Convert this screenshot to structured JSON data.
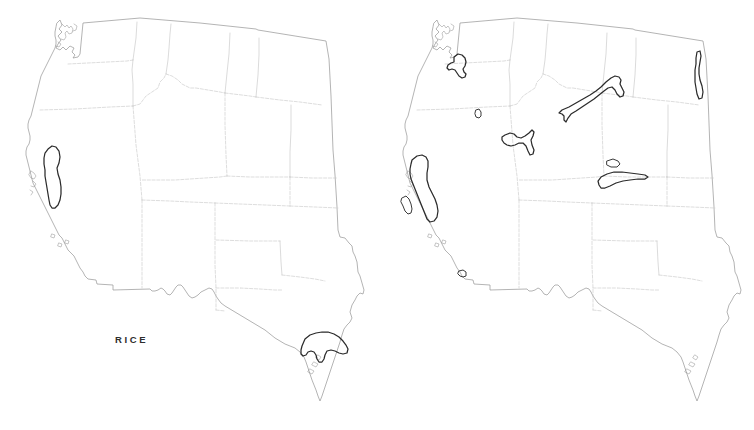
{
  "figure": {
    "type": "thematic-map-pair",
    "background_color": "#ffffff",
    "width": 754,
    "height": 430
  },
  "style": {
    "outline_color": "#9b9b9b",
    "state_boundary_color": "#c2c2c2",
    "crop_area_color": "#2b2b2b",
    "label_color": "#2e2e2e"
  },
  "panels": [
    {
      "id": "rice",
      "label": "RICE",
      "label_x": 115,
      "label_y": 334,
      "crop_regions": [
        {
          "name": "Sacramento Valley, California",
          "state": "CA"
        },
        {
          "name": "Gulf Coast Prairie, Texas",
          "state": "TX"
        }
      ]
    },
    {
      "id": "sugar-beets",
      "label": "SUGAR BEETS",
      "label_x": 452,
      "label_y": 334,
      "crop_regions": [
        {
          "name": "Yakima Valley, Washington",
          "state": "WA"
        },
        {
          "name": "Eastern Oregon",
          "state": "OR"
        },
        {
          "name": "Snake River Plain, Idaho",
          "state": "ID"
        },
        {
          "name": "Yellowstone / Big Horn Basin, Montana and Wyoming",
          "state": "MT-WY"
        },
        {
          "name": "Red River Valley, North Dakota",
          "state": "ND"
        },
        {
          "name": "North Platte Valley, Nebraska",
          "state": "NE"
        },
        {
          "name": "South Platte Valley, Colorado",
          "state": "CO"
        },
        {
          "name": "Central Valley, California",
          "state": "CA"
        },
        {
          "name": "Salinas Valley, California",
          "state": "CA"
        },
        {
          "name": "Imperial Valley, California",
          "state": "CA"
        }
      ]
    }
  ],
  "map_region": {
    "name": "Western United States",
    "states_shown": [
      "Washington",
      "Oregon",
      "California",
      "Idaho",
      "Nevada",
      "Utah",
      "Arizona",
      "Montana",
      "Wyoming",
      "Colorado",
      "New Mexico",
      "North Dakota",
      "South Dakota",
      "Nebraska",
      "Kansas",
      "Oklahoma",
      "Texas"
    ]
  }
}
